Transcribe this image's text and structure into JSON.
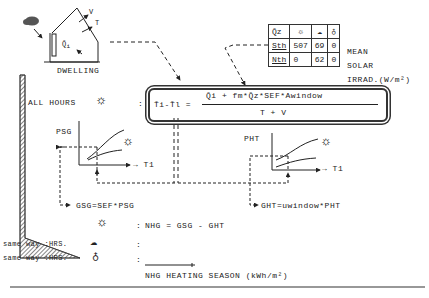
{
  "dwelling": {
    "label": "DWELLING",
    "labels": {
      "v": "V",
      "t": "T",
      "qi": "Q̄",
      "qi_sub": "i"
    }
  },
  "irradiance_table": {
    "header": [
      "Q̄z",
      "sun-icon",
      "cloud-icon",
      "lamp-icon"
    ],
    "rows": [
      {
        "label": "Sth",
        "values": [
          "507",
          "69",
          "0"
        ]
      },
      {
        "label": "Nth",
        "values": [
          "0",
          "62",
          "0"
        ]
      }
    ],
    "caption_line1": "MEAN",
    "caption_line2": "SOLAR",
    "caption_line3": "IRRAD.(W/m²)"
  },
  "all_hours": {
    "label": "ALL HOURS",
    "colon": ":"
  },
  "formula": {
    "lhs": "T̄i-T̄l =",
    "numerator": "Q̄i + fm*Q̄z*SEF*Awindow",
    "denominator": "T + V"
  },
  "graphs": {
    "psg": {
      "ylabel": "PSG",
      "xlabel": "→ T1"
    },
    "pht": {
      "ylabel": "PHT",
      "xlabel": "→ T1"
    }
  },
  "equations": {
    "gsg": "GSG=SEF*PSG",
    "ght": "GHT=uwindow*PHT",
    "nhg": "NHG = GSG - GHT"
  },
  "same_way": [
    {
      "label": "same way :HRS.",
      "icon": "cloud-icon",
      "colon": ":"
    },
    {
      "label": "same way :HRS.",
      "icon": "lamp-icon",
      "colon": ":"
    }
  ],
  "nhg_caption": "NHG HEATING SEASON (kWh/m²)"
}
